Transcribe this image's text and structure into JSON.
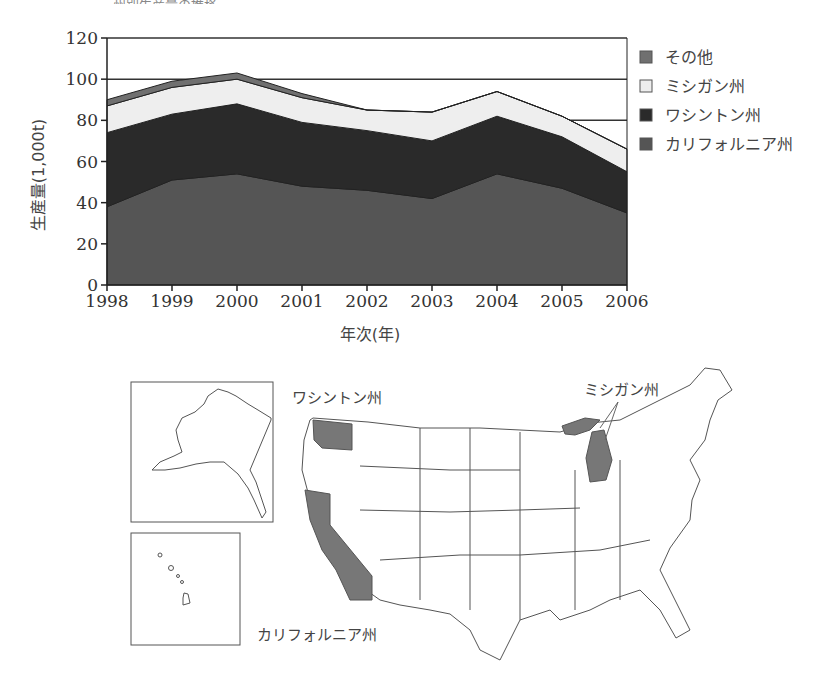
{
  "header": {
    "cut_title": "…州別生産量の推移"
  },
  "chart_data": {
    "type": "area",
    "stacked": true,
    "title": "",
    "xlabel": "年次(年)",
    "ylabel": "生産量(1,000t)",
    "ylim": [
      0,
      120
    ],
    "yticks": [
      0,
      20,
      40,
      60,
      80,
      100,
      120
    ],
    "categories": [
      "1998",
      "1999",
      "2000",
      "2001",
      "2002",
      "2003",
      "2004",
      "2005",
      "2006"
    ],
    "grid": "horizontal at 80, 100, 120",
    "legend_position": "right",
    "series": [
      {
        "name": "カリフォルニア州",
        "color": "#555555",
        "values": [
          38,
          51,
          54,
          48,
          46,
          42,
          54,
          47,
          35
        ]
      },
      {
        "name": "ワシントン州",
        "color": "#2a2a2a",
        "values": [
          36,
          32,
          34,
          31,
          29,
          28,
          28,
          25,
          20
        ]
      },
      {
        "name": "ミシガン州",
        "color": "#eeeeee",
        "values": [
          13,
          13,
          12,
          12,
          10,
          14,
          12,
          10,
          11
        ]
      },
      {
        "name": "その他",
        "color": "#707070",
        "values": [
          3,
          3,
          3,
          2,
          0,
          0,
          0,
          0,
          0
        ]
      }
    ],
    "legend": [
      "その他",
      "ミシガン州",
      "ワシントン州",
      "カリフォルニア州"
    ]
  },
  "map": {
    "labels": {
      "washington": "ワシントン州",
      "michigan": "ミシガン州",
      "california": "カリフォルニア州"
    },
    "highlight_color": "#777777"
  }
}
